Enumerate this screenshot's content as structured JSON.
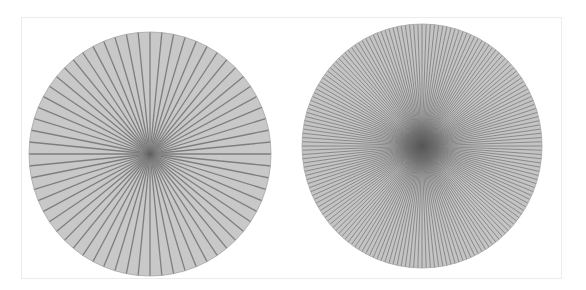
{
  "figure": {
    "panels": [
      {
        "name": "sparse-spoke-wheel",
        "cx": 150,
        "cy": 154,
        "rx": 121,
        "ry": 122,
        "spoke_count": 64,
        "fill": "#c8c8c8",
        "spoke_color": "#7e7e7e",
        "spoke_width": 1.3,
        "edge_color": "#a6a6a6",
        "center_blur_radius": 10,
        "center_color": "#5a5a5a"
      },
      {
        "name": "dense-spoke-wheel",
        "cx": 422,
        "cy": 146,
        "rx": 120,
        "ry": 122,
        "spoke_count": 180,
        "fill": "#c4c4c4",
        "spoke_color": "#828282",
        "spoke_width": 0.9,
        "edge_color": "#a6a6a6",
        "center_blur_radius": 36,
        "center_color": "#4e4e4e"
      }
    ],
    "frame_border_color": "#ececec",
    "background": "#ffffff"
  }
}
